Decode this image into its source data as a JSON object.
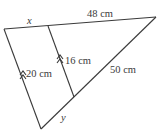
{
  "diagram": {
    "type": "triangle-with-parallel-segments",
    "labels": {
      "top_left_segment": "x",
      "top_right_segment": "48 cm",
      "left_parallel_side": "20 cm",
      "inner_parallel_segment": "16 cm",
      "hypotenuse_upper": "50 cm",
      "hypotenuse_lower": "y"
    },
    "colors": {
      "line": "#3a3a3a",
      "background": "#ffffff"
    }
  }
}
